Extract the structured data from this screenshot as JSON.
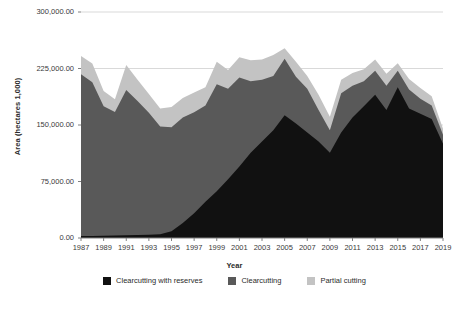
{
  "chart_data": {
    "type": "area",
    "stacked": true,
    "title": "",
    "xlabel": "Year",
    "ylabel": "Area (hectares 1,000)",
    "ylim": [
      0,
      300000
    ],
    "yticks": [
      0,
      75000,
      150000,
      225000,
      300000
    ],
    "ytick_labels": [
      "0.00",
      "75,000.00",
      "150,000.00",
      "225,000.00",
      "300,000.00"
    ],
    "grid": true,
    "legend_position": "bottom",
    "x": [
      1987,
      1988,
      1989,
      1990,
      1991,
      1992,
      1993,
      1994,
      1995,
      1996,
      1997,
      1998,
      1999,
      2000,
      2001,
      2002,
      2003,
      2004,
      2005,
      2006,
      2007,
      2008,
      2009,
      2010,
      2011,
      2012,
      2013,
      2014,
      2015,
      2016,
      2017,
      2018,
      2019
    ],
    "xtick_labels": [
      "1987",
      "1989",
      "1991",
      "1993",
      "1995",
      "1997",
      "1999",
      "2001",
      "2003",
      "2005",
      "2007",
      "2009",
      "2011",
      "2013",
      "2015",
      "2017",
      "2019"
    ],
    "series": [
      {
        "name": "Clearcutting with reserves",
        "color": "#111111",
        "values": [
          2500,
          2800,
          3000,
          3200,
          3600,
          4000,
          4200,
          5000,
          9000,
          20000,
          33000,
          48000,
          62000,
          78000,
          95000,
          113000,
          128000,
          143000,
          163000,
          152000,
          140000,
          128000,
          113000,
          140000,
          160000,
          175000,
          190000,
          170000,
          200000,
          172000,
          165000,
          158000,
          125000
        ]
      },
      {
        "name": "Clearcutting",
        "color": "#595959",
        "values": [
          215000,
          204000,
          172000,
          164000,
          193000,
          178000,
          162000,
          143000,
          138000,
          140000,
          134000,
          128000,
          142000,
          120000,
          118000,
          95000,
          82000,
          72000,
          75000,
          62000,
          58000,
          42000,
          30000,
          52000,
          42000,
          33000,
          32000,
          32000,
          22000,
          25000,
          20000,
          18000,
          12000
        ]
      },
      {
        "name": "Partial cutting",
        "color": "#c3c3c3",
        "values": [
          24000,
          25000,
          20000,
          17000,
          33000,
          28000,
          25000,
          24000,
          27000,
          26000,
          26000,
          24000,
          30000,
          25000,
          27000,
          28000,
          27000,
          28000,
          14000,
          20000,
          17000,
          20000,
          18000,
          18000,
          17000,
          16000,
          15000,
          16000,
          10000,
          14000,
          14000,
          12000,
          8000
        ]
      }
    ]
  },
  "legend": {
    "items": [
      {
        "label": "Clearcutting with reserves",
        "color": "#111111"
      },
      {
        "label": "Clearcutting",
        "color": "#595959"
      },
      {
        "label": "Partial cutting",
        "color": "#c3c3c3"
      }
    ]
  },
  "axes": {
    "x_title": "Year",
    "y_title": "Area (hectares 1,000)"
  },
  "style": {
    "gridline_color": "#d9d9d9",
    "axis_color": "#808080",
    "text_color": "#3a3a3a",
    "background": "#ffffff"
  }
}
